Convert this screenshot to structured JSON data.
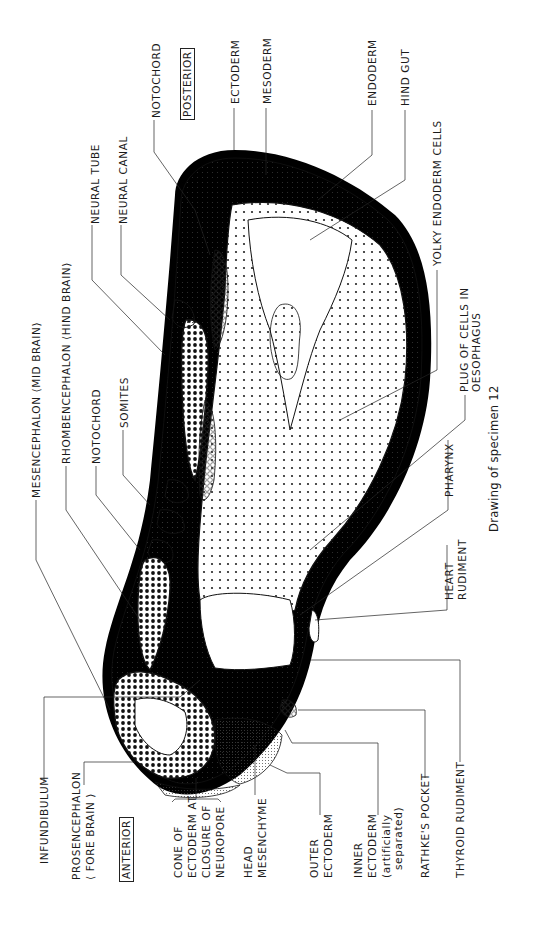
{
  "figure": {
    "caption": "Drawing of specimen 12",
    "orientation": {
      "anterior": "ANTERIOR",
      "posterior": "POSTERIOR"
    },
    "labels": {
      "notochord_posterior": "NOTOCHORD",
      "ectoderm": "ECTODERM",
      "mesoderm": "MESODERM",
      "endoderm": "ENDODERM",
      "hind_gut": "HIND GUT",
      "yolky_endoderm_cells": "YOLKY ENDODERM CELLS",
      "neural_tube": "NEURAL TUBE",
      "neural_canal": "NEURAL CANAL",
      "mesencephalon": "MESENCEPHALON ⟨MID BRAIN⟩",
      "rhombencephalon": "RHOMBENCEPHALON ⟨HIND BRAIN⟩",
      "notochord_mid": "NOTOCHORD",
      "somites": "SOMITES",
      "plug_line1": "PLUG OF CELLS IN",
      "plug_line2": "OESOPHAGUS",
      "pharynx": "PHARYNX",
      "heart_line1": "HEART",
      "heart_line2": "RUDIMENT",
      "infundibulum": "INFUNDIBULUM",
      "prosencephalon_line1": "PROSENCEPHALON",
      "prosencephalon_line2": "⟨ FORE BRAIN ⟩",
      "cone_line1": "CONE OF",
      "cone_line2": "ECTODERM AT",
      "cone_line3": "CLOSURE OF",
      "cone_line4": "NEUROPORE",
      "head_mes_line1": "HEAD",
      "head_mes_line2": "MESENCHYME",
      "outer_ect_line1": "OUTER",
      "outer_ect_line2": "ECTODERM",
      "inner_ect_line1": "INNER",
      "inner_ect_line2": "ECTODERM",
      "inner_ect_line3": "(artificially",
      "inner_ect_line4": "separated)",
      "rathkes_pocket": "RATHKE'S POCKET",
      "thyroid_rudiment": "THYROID RUDIMENT"
    }
  }
}
